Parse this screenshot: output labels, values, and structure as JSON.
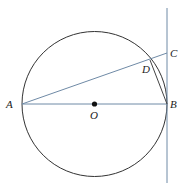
{
  "diagram": {
    "type": "circle-tangent-geometry",
    "colors": {
      "circle": "#333333",
      "line": "#6f8aa6",
      "chord": "#444444",
      "point": "#111111"
    },
    "circle": {
      "center": "O",
      "cx": 94.5,
      "cy": 104,
      "r": 72.5
    },
    "points": [
      {
        "id": "A",
        "label": "A",
        "x": 22,
        "y": 104,
        "lx": 6,
        "ly": 108
      },
      {
        "id": "B",
        "label": "B",
        "x": 167,
        "y": 104,
        "lx": 170,
        "ly": 108
      },
      {
        "id": "C",
        "label": "C",
        "x": 167,
        "y": 53,
        "lx": 170,
        "ly": 57
      },
      {
        "id": "D",
        "label": "D",
        "x": 150,
        "y": 60,
        "lx": 142,
        "ly": 73
      },
      {
        "id": "O",
        "label": "O",
        "x": 94.5,
        "y": 104,
        "lx": 90,
        "ly": 119
      }
    ],
    "segments": [
      {
        "name": "AB",
        "from": "A",
        "to": "B"
      },
      {
        "name": "AC",
        "from": "A",
        "to": "C"
      },
      {
        "name": "DB",
        "from": "D",
        "to": "B"
      }
    ],
    "tangent_line": {
      "name": "tangent-at-B",
      "x": 167,
      "y1": 8,
      "y2": 183
    }
  }
}
